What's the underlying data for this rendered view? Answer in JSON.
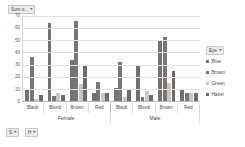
{
  "value_field_button": {
    "label": "Sum o...",
    "caret": "▾"
  },
  "legend_field_button": {
    "label": "Eye",
    "caret": "▾"
  },
  "axis_field_buttons": [
    {
      "label": "S",
      "caret": "▾"
    },
    {
      "label": "H",
      "caret": "▾"
    }
  ],
  "legend": {
    "title": "Eye",
    "items": [
      {
        "label": "Blue",
        "color": "#767171"
      },
      {
        "label": "Brown",
        "color": "#7b7575"
      },
      {
        "label": "Green",
        "color": "#c9c6c6"
      },
      {
        "label": "Hazel",
        "color": "#6e6a6a"
      }
    ]
  },
  "colors": {
    "plot_background": "#ffffff",
    "gridline": "#e2e2e2",
    "axis": "#b8b8b8",
    "text": "#4a4a4a",
    "field_button_fill": "#eceaea",
    "field_button_border": "#c9c6c6"
  },
  "chart_data": {
    "type": "bar",
    "title": "",
    "xlabel": "",
    "ylabel": "",
    "ylim": [
      0,
      70
    ],
    "yticks": [
      0,
      10,
      20,
      30,
      40,
      50,
      60,
      70
    ],
    "grid": true,
    "legend_position": "right",
    "categories": [
      "Black",
      "Blond",
      "Brown",
      "Red",
      "Black",
      "Blond",
      "Brown",
      "Red"
    ],
    "group_labels": [
      "Female",
      "Male"
    ],
    "groups": [
      {
        "label": "Female",
        "categories": [
          "Black",
          "Blond",
          "Brown",
          "Red"
        ]
      },
      {
        "label": "Male",
        "categories": [
          "Black",
          "Blond",
          "Brown",
          "Red"
        ]
      }
    ],
    "series": [
      {
        "name": "Blue",
        "color": "#767171",
        "values": [
          9,
          64,
          34,
          7,
          11,
          30,
          50,
          10
        ]
      },
      {
        "name": "Brown",
        "color": "#7b7575",
        "values": [
          36,
          4,
          66,
          16,
          32,
          3,
          53,
          7
        ]
      },
      {
        "name": "Green",
        "color": "#c9c6c6",
        "values": [
          2,
          7,
          14,
          7,
          3,
          8,
          15,
          7
        ]
      },
      {
        "name": "Hazel",
        "color": "#6e6a6a",
        "values": [
          5,
          5,
          29,
          7,
          10,
          5,
          25,
          7
        ]
      }
    ]
  }
}
